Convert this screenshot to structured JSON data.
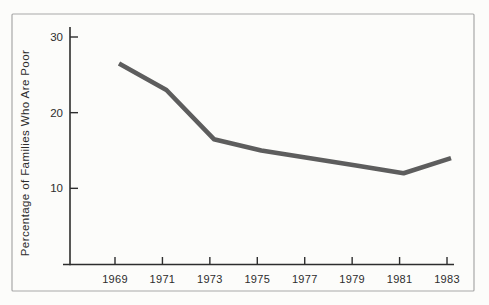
{
  "figure": {
    "colors": {
      "background": "#fcfcfa",
      "frame_border": "#a8a8a8",
      "axis": "#2d2d2d",
      "text": "#2d2d2d",
      "data_line": "#5d5d5d"
    }
  },
  "chart_data": {
    "type": "line",
    "title": "",
    "xlabel": "",
    "ylabel": "Percentage of Families Who Are Poor",
    "categories": [
      "1969",
      "1971",
      "1973",
      "1975",
      "1977",
      "1979",
      "1981",
      "1983"
    ],
    "x": [
      1969,
      1971,
      1973,
      1975,
      1977,
      1979,
      1981,
      1983
    ],
    "values": [
      26.5,
      23,
      16.5,
      15,
      14,
      13,
      12,
      14
    ],
    "y_ticks": [
      10,
      20,
      30
    ],
    "ylim": [
      0,
      32
    ],
    "grid": false,
    "legend": false,
    "series_name": "percentage-of-families-who-are-poor"
  }
}
